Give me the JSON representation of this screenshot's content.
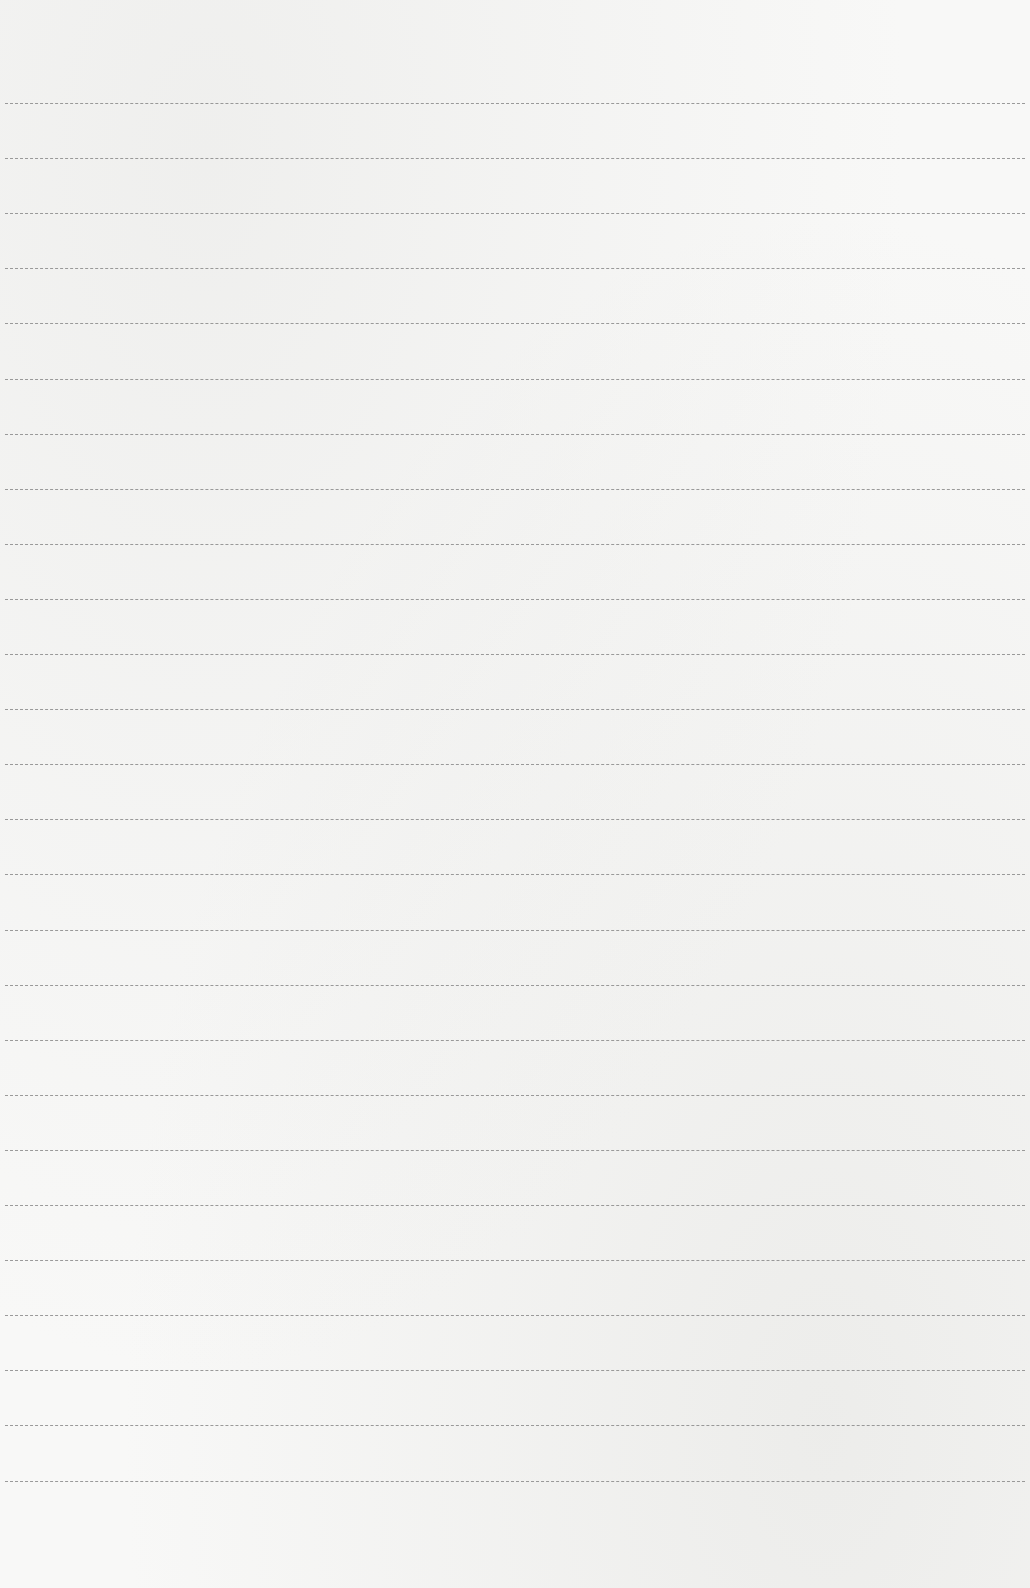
{
  "paper": {
    "type": "lined-paper",
    "background_color": "#f8f8f7",
    "line_color": "#8a8a8a",
    "line_count": 26,
    "first_line_y": 103,
    "line_spacing": 55.1,
    "content": ""
  }
}
